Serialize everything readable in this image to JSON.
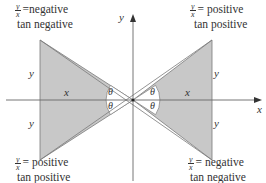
{
  "diagram": {
    "type": "trigonometry-tangent-sign-diagram",
    "axes": {
      "x_label": "x",
      "y_label": "y"
    },
    "angle_symbol": "θ",
    "triangles": {
      "left": {
        "horizontal_label": "x",
        "upper_vertical_label": "y",
        "lower_vertical_label": "y"
      },
      "right": {
        "horizontal_label": "x",
        "upper_vertical_label": "y",
        "lower_vertical_label": "y"
      }
    },
    "annotations": {
      "top_left": {
        "frac_num": "y",
        "frac_den": "x",
        "ratio_text": "=negative",
        "tan_text": "tan negative"
      },
      "top_right": {
        "frac_num": "y",
        "frac_den": "x",
        "ratio_text": "= positive",
        "tan_text": "tan positive"
      },
      "bottom_left": {
        "frac_num": "y",
        "frac_den": "x",
        "ratio_text": "= positive",
        "tan_text": "tan positive"
      },
      "bottom_right": {
        "frac_num": "y",
        "frac_den": "x",
        "ratio_text": "= negative",
        "tan_text": "tan negative"
      }
    },
    "colors": {
      "shade": "#c8c8c8",
      "line": "#777777",
      "axis": "#666666",
      "text": "#333333"
    }
  }
}
